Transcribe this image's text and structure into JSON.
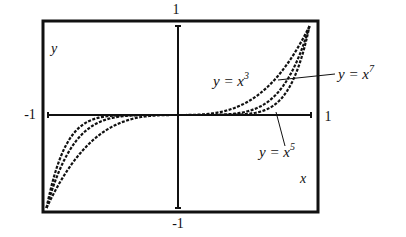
{
  "chart_data": {
    "type": "line",
    "title": "",
    "xlabel": "x",
    "ylabel": "y",
    "xlim": [
      -1,
      1
    ],
    "ylim": [
      -1,
      1
    ],
    "grid": false,
    "legend": "inline annotations with leader lines",
    "tick_labels": {
      "x_left": "-1",
      "x_right": "1",
      "y_top": "1",
      "y_bottom": "-1"
    },
    "series": [
      {
        "name": "y = x^3",
        "exponent": 3,
        "x": [
          -1,
          -0.75,
          -0.5,
          -0.25,
          0,
          0.25,
          0.5,
          0.75,
          1
        ],
        "y": [
          -1,
          -0.422,
          -0.125,
          -0.016,
          0,
          0.016,
          0.125,
          0.422,
          1
        ]
      },
      {
        "name": "y = x^5",
        "exponent": 5,
        "x": [
          -1,
          -0.75,
          -0.5,
          -0.25,
          0,
          0.25,
          0.5,
          0.75,
          1
        ],
        "y": [
          -1,
          -0.237,
          -0.031,
          -0.001,
          0,
          0.001,
          0.031,
          0.237,
          1
        ]
      },
      {
        "name": "y = x^7",
        "exponent": 7,
        "x": [
          -1,
          -0.75,
          -0.5,
          -0.25,
          0,
          0.25,
          0.5,
          0.75,
          1
        ],
        "y": [
          -1,
          -0.133,
          -0.008,
          0.0,
          0,
          0.0,
          0.008,
          0.133,
          1
        ]
      }
    ],
    "annotations": [
      {
        "text": "y = x3",
        "base": "y = x",
        "sup": "3"
      },
      {
        "text": "y = x7",
        "base": "y = x",
        "sup": "7"
      },
      {
        "text": "y = x5",
        "base": "y = x",
        "sup": "5"
      }
    ]
  },
  "labels": {
    "y_axis": "y",
    "x_axis": "x",
    "y_top": "1",
    "y_bottom": "-1",
    "x_left": "-1",
    "x_right": "1",
    "ann_x3_base": "y = x",
    "ann_x3_sup": "3",
    "ann_x7_base": "y = x",
    "ann_x7_sup": "7",
    "ann_x5_base": "y = x",
    "ann_x5_sup": "5"
  },
  "colors": {
    "ink": "#111111",
    "background": "#ffffff"
  }
}
